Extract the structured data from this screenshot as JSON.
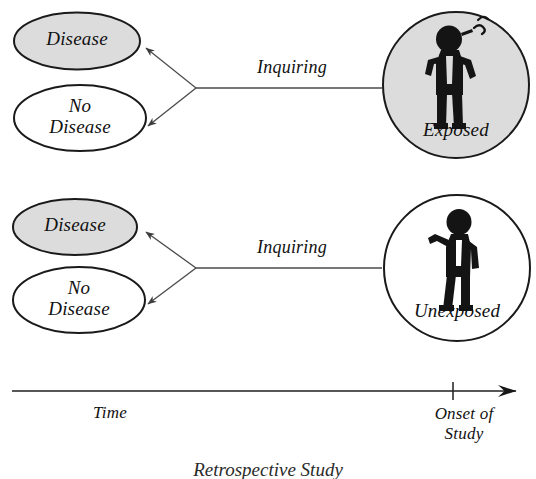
{
  "diagram": {
    "title": "Retrospective Study",
    "type": "epidemiology-study-design-diagram",
    "colors": {
      "ink": "#1a1a1a",
      "shaded_fill": "#dcdcdc",
      "plain_fill": "#ffffff",
      "line": "#4a4a4a",
      "figure": "#141414"
    }
  },
  "rows": [
    {
      "id": "exposed-row",
      "outcomes": [
        {
          "label": "Disease",
          "shaded": true
        },
        {
          "label": "No\nDisease",
          "shaded": false
        }
      ],
      "edge_label": "Inquiring",
      "group": {
        "label": "Exposed",
        "shaded": true,
        "icon": "smoking-person-icon"
      }
    },
    {
      "id": "unexposed-row",
      "outcomes": [
        {
          "label": "Disease",
          "shaded": true
        },
        {
          "label": "No\nDisease",
          "shaded": false
        }
      ],
      "edge_label": "Inquiring",
      "group": {
        "label": "Unexposed",
        "shaded": false,
        "icon": "standing-person-icon"
      }
    }
  ],
  "axis": {
    "time_label": "Time",
    "onset_label": "Onset of\nStudy",
    "direction": "right-arrow"
  },
  "caption": "Retrospective Study"
}
